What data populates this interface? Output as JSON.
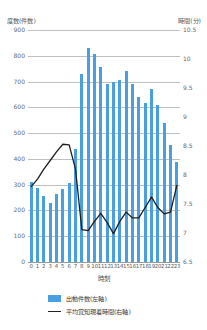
{
  "chart_data": {
    "type": "bar",
    "title": "",
    "xlabel": "時刻",
    "ylabel": "度数(件数)",
    "y2label": "時間(分)",
    "categories": [
      "0",
      "1",
      "2",
      "3",
      "4",
      "5",
      "6",
      "7",
      "8",
      "9",
      "10",
      "11",
      "12",
      "13",
      "14",
      "15",
      "16",
      "17",
      "18",
      "19",
      "20",
      "21",
      "22",
      "23"
    ],
    "ylim": [
      0,
      900
    ],
    "y2lim": [
      6.5,
      10.5
    ],
    "yticks": [
      "0",
      "100",
      "200",
      "300",
      "400",
      "500",
      "600",
      "700",
      "800",
      "900"
    ],
    "y2ticks": [
      "6.5",
      "7",
      "7.5",
      "8",
      "8.5",
      "9",
      "9.5",
      "10",
      "10.5"
    ],
    "grid": true,
    "legend_position": "bottom-left",
    "series": [
      {
        "name": "出動件数(左軸)",
        "type": "bar",
        "axis": "left",
        "color": "#4a9fe0",
        "values": [
          310,
          288,
          258,
          228,
          265,
          285,
          308,
          440,
          730,
          830,
          808,
          758,
          690,
          700,
          705,
          740,
          690,
          640,
          618,
          670,
          608,
          540,
          452,
          388
        ]
      },
      {
        "name": "平均覚知現着時間(右軸)",
        "type": "line",
        "axis": "right",
        "color": "#1e1e1e",
        "values": [
          7.8,
          7.93,
          8.1,
          8.25,
          8.4,
          8.53,
          8.52,
          8.1,
          7.06,
          7.04,
          7.2,
          7.34,
          7.18,
          6.99,
          7.2,
          7.36,
          7.26,
          7.26,
          7.44,
          7.62,
          7.44,
          7.33,
          7.36,
          7.82
        ]
      }
    ]
  },
  "legend": {
    "items": [
      {
        "label": "出動件数(左軸)",
        "marker": "bar-swatch"
      },
      {
        "label": "平均覚知現着時間(右軸)",
        "marker": "line-swatch"
      }
    ]
  }
}
